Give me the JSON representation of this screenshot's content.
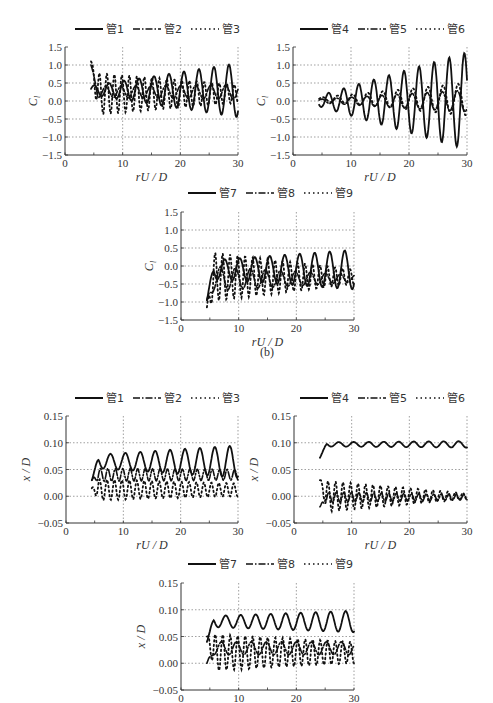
{
  "figure": {
    "caption_b": "(b)"
  },
  "chart_data": [
    {
      "id": "cl-pipes-1-3",
      "type": "line",
      "title": "",
      "xlabel": "rU/D",
      "ylabel": "C_l",
      "xlim": [
        0,
        30
      ],
      "ylim": [
        -1.5,
        1.5
      ],
      "xticks": [
        0,
        10,
        20,
        30
      ],
      "yticks": [
        1.5,
        1.0,
        0.5,
        0.0,
        -0.5,
        -1.0,
        -1.5
      ],
      "ytick_labels": [
        "1.5",
        "1.0",
        "0.5",
        "0.0",
        "−0.5",
        "−1.0",
        "−1.5"
      ],
      "grid": "dotted",
      "legend_position": "top",
      "series": [
        {
          "name": "管1",
          "style": "solid",
          "x0": 4.5,
          "x1": 30,
          "base": 0.3,
          "amp0": 0.12,
          "amp1": 0.75,
          "period": 2.6,
          "phase": 0.3,
          "drift": 0.0
        },
        {
          "name": "管2",
          "style": "dashdot",
          "x0": 4.5,
          "x1": 30,
          "base": 0.25,
          "amp0": 0.15,
          "amp1": 0.2,
          "period": 2.6,
          "phase": 1.6,
          "drift": 0.0,
          "start": 1.0
        },
        {
          "name": "管3",
          "style": "dotted",
          "x0": 4.5,
          "x1": 30,
          "base": 0.2,
          "amp0": 0.6,
          "amp1": 0.25,
          "period": 1.3,
          "phase": 0.8,
          "drift": 0.0,
          "start": 1.1
        }
      ]
    },
    {
      "id": "cl-pipes-4-6",
      "type": "line",
      "title": "",
      "xlabel": "rU/D",
      "ylabel": "C_l",
      "xlim": [
        0,
        30
      ],
      "ylim": [
        -1.5,
        1.5
      ],
      "xticks": [
        0,
        10,
        20,
        30
      ],
      "yticks": [
        1.5,
        1.0,
        0.5,
        0.0,
        -0.5,
        -1.0,
        -1.5
      ],
      "ytick_labels": [
        "1.5",
        "1.0",
        "0.5",
        "0.0",
        "−0.5",
        "−1.0",
        "−1.5"
      ],
      "grid": "dotted",
      "legend_position": "top",
      "series": [
        {
          "name": "管4",
          "style": "solid",
          "x0": 4.5,
          "x1": 30,
          "base": 0.0,
          "amp0": 0.15,
          "amp1": 1.35,
          "period": 2.6,
          "phase": 3.9,
          "drift": 0.0
        },
        {
          "name": "管5",
          "style": "dashdot",
          "x0": 4.5,
          "x1": 30,
          "base": 0.0,
          "amp0": 0.05,
          "amp1": 0.3,
          "period": 2.6,
          "phase": 0.5,
          "drift": 0.0
        },
        {
          "name": "管6",
          "style": "dotted",
          "x0": 4.5,
          "x1": 30,
          "base": 0.05,
          "amp0": 0.05,
          "amp1": 0.45,
          "period": 2.6,
          "phase": 0.2,
          "drift": 0.0
        }
      ]
    },
    {
      "id": "cl-pipes-7-9",
      "type": "line",
      "title": "",
      "xlabel": "rU/D",
      "ylabel": "C_l",
      "xlim": [
        0,
        30
      ],
      "ylim": [
        -1.5,
        1.5
      ],
      "xticks": [
        0,
        10,
        20,
        30
      ],
      "yticks": [
        1.5,
        1.0,
        0.5,
        0.0,
        -0.5,
        -1.0,
        -1.5
      ],
      "ytick_labels": [
        "1.5",
        "1.0",
        "0.5",
        "0.0",
        "−0.5",
        "−1.0",
        "−1.5"
      ],
      "grid": "dotted",
      "legend_position": "top",
      "caption": "(b)",
      "series": [
        {
          "name": "管7",
          "style": "solid",
          "x0": 4.5,
          "x1": 30,
          "base": -0.1,
          "amp0": 0.25,
          "amp1": 0.55,
          "period": 2.6,
          "phase": 0.4,
          "drift": 0.0,
          "start": -0.95
        },
        {
          "name": "管8",
          "style": "dashdot",
          "x0": 4.5,
          "x1": 30,
          "base": -0.35,
          "amp0": 0.35,
          "amp1": 0.1,
          "period": 2.6,
          "phase": 2.2,
          "drift": 0.0,
          "start": -0.95
        },
        {
          "name": "管9",
          "style": "dotted",
          "x0": 4.5,
          "x1": 30,
          "base": -0.3,
          "amp0": 0.7,
          "amp1": 0.2,
          "period": 1.3,
          "phase": 1.0,
          "drift": 0.0,
          "start": -1.15
        }
      ]
    },
    {
      "id": "xd-pipes-1-3",
      "type": "line",
      "title": "",
      "xlabel": "rU/D",
      "ylabel": "x/D",
      "xlim": [
        0,
        30
      ],
      "ylim": [
        -0.05,
        0.15
      ],
      "xticks": [
        0,
        10,
        20,
        30
      ],
      "yticks": [
        0.15,
        0.1,
        0.05,
        0.0,
        -0.05
      ],
      "ytick_labels": [
        "0.15",
        "0.10",
        "0.05",
        "0.00",
        "−0.05"
      ],
      "grid": "dotted",
      "legend_position": "top",
      "series": [
        {
          "name": "管1",
          "style": "solid",
          "x0": 4.5,
          "x1": 30,
          "base": 0.065,
          "amp0": 0.012,
          "amp1": 0.03,
          "period": 2.6,
          "phase": 0.0,
          "drift": 0.0,
          "start": 0.03
        },
        {
          "name": "管2",
          "style": "dashdot",
          "x0": 4.5,
          "x1": 30,
          "base": 0.04,
          "amp0": 0.012,
          "amp1": 0.01,
          "period": 1.3,
          "phase": 0.6,
          "drift": 0.0,
          "start": 0.03
        },
        {
          "name": "管3",
          "style": "dotted",
          "x0": 4.5,
          "x1": 30,
          "base": 0.012,
          "amp0": 0.02,
          "amp1": 0.012,
          "period": 1.3,
          "phase": 1.3,
          "drift": 0.0,
          "start": 0.015
        }
      ]
    },
    {
      "id": "xd-pipes-4-6",
      "type": "line",
      "title": "",
      "xlabel": "rU/D",
      "ylabel": "x/D",
      "xlim": [
        0,
        30
      ],
      "ylim": [
        -0.05,
        0.15
      ],
      "xticks": [
        0,
        10,
        20,
        30
      ],
      "yticks": [
        0.15,
        0.1,
        0.05,
        0.0,
        -0.05
      ],
      "ytick_labels": [
        "0.15",
        "0.10",
        "0.05",
        "0.00",
        "−0.05"
      ],
      "grid": "dotted",
      "legend_position": "top",
      "series": [
        {
          "name": "管4",
          "style": "solid",
          "x0": 4.5,
          "x1": 30,
          "base": 0.097,
          "amp0": 0.004,
          "amp1": 0.006,
          "period": 2.6,
          "phase": 0.0,
          "drift": 0.0,
          "start": 0.072
        },
        {
          "name": "管5",
          "style": "dashdot",
          "x0": 4.5,
          "x1": 30,
          "base": -0.002,
          "amp0": 0.01,
          "amp1": 0.005,
          "period": 1.3,
          "phase": 0.4,
          "drift": 0.0,
          "start": -0.02
        },
        {
          "name": "管6",
          "style": "dotted",
          "x0": 4.5,
          "x1": 30,
          "base": 0.0,
          "amp0": 0.03,
          "amp1": 0.006,
          "period": 1.3,
          "phase": 1.1,
          "drift": 0.0,
          "start": 0.03
        }
      ]
    },
    {
      "id": "xd-pipes-7-9",
      "type": "line",
      "title": "",
      "xlabel": "",
      "ylabel": "x/D",
      "xlim": [
        0,
        30
      ],
      "ylim": [
        -0.05,
        0.15
      ],
      "xticks": [
        0,
        10,
        20,
        30
      ],
      "yticks": [
        0.15,
        0.1,
        0.05,
        0.0,
        -0.05
      ],
      "ytick_labels": [
        "0.15",
        "0.10",
        "0.05",
        "0.00",
        "−0.05"
      ],
      "grid": "dotted",
      "legend_position": "top",
      "series": [
        {
          "name": "管7",
          "style": "solid",
          "x0": 4.5,
          "x1": 30,
          "base": 0.078,
          "amp0": 0.01,
          "amp1": 0.02,
          "period": 2.6,
          "phase": 0.0,
          "drift": 0.0,
          "start": 0.04
        },
        {
          "name": "管8",
          "style": "dashdot",
          "x0": 4.5,
          "x1": 30,
          "base": 0.028,
          "amp0": 0.012,
          "amp1": 0.012,
          "period": 2.6,
          "phase": 1.8,
          "drift": 0.0,
          "start": 0.0
        },
        {
          "name": "管9",
          "style": "dotted",
          "x0": 4.5,
          "x1": 30,
          "base": 0.02,
          "amp0": 0.035,
          "amp1": 0.02,
          "period": 1.3,
          "phase": 0.9,
          "drift": 0.0,
          "start": 0.05
        }
      ]
    }
  ]
}
